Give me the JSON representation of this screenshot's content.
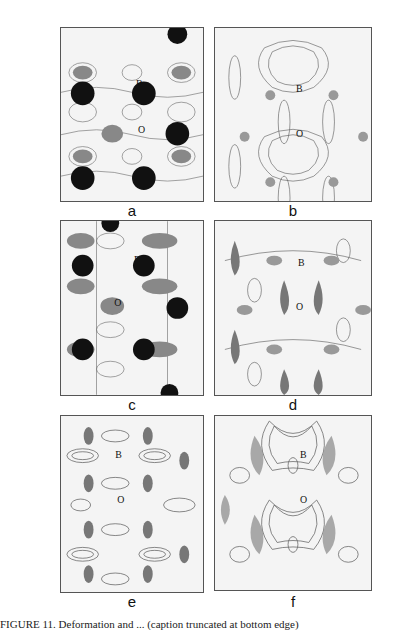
{
  "figure": {
    "panels": [
      {
        "id": "a",
        "label": "a",
        "atoms": [
          "B",
          "O"
        ],
        "style": "blobs-dark"
      },
      {
        "id": "b",
        "label": "b",
        "atoms": [
          "B",
          "O"
        ],
        "style": "contour-light"
      },
      {
        "id": "c",
        "label": "c",
        "atoms": [
          "B",
          "O"
        ],
        "style": "blobs-dark"
      },
      {
        "id": "d",
        "label": "d",
        "atoms": [
          "B",
          "O"
        ],
        "style": "contour-mid"
      },
      {
        "id": "e",
        "label": "e",
        "atoms": [
          "B",
          "O"
        ],
        "style": "contour-dense"
      },
      {
        "id": "f",
        "label": "f",
        "atoms": [
          "B",
          "O"
        ],
        "style": "contour-mid"
      }
    ],
    "caption": "FIGURE 11. Deformation and ... (caption truncated at bottom edge)"
  },
  "colors": {
    "ink": "#111111",
    "contour": "#555555",
    "shade_dark": "#111111",
    "shade_mid": "#777777",
    "background": "#f4f4f4"
  }
}
